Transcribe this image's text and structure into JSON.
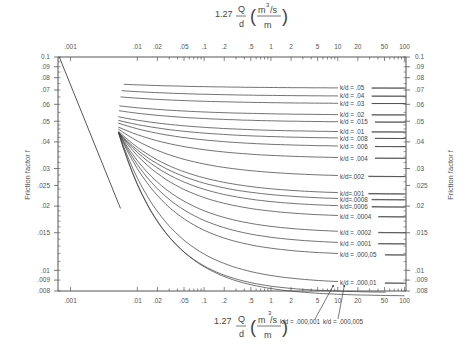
{
  "chart_data": {
    "type": "line",
    "title": "",
    "xlabel": "1.27 Q/d (m³/s / m)",
    "xlabel_parts": {
      "coef": "1.27",
      "num": "Q",
      "den": "d",
      "unit_num": "m",
      "unit_sup": "3",
      "unit_num_rest": "/s",
      "unit_den": "m"
    },
    "ylabel": "Friction factor f",
    "xscale": "log",
    "yscale": "log",
    "xlim": [
      0.00065,
      105
    ],
    "ylim": [
      0.008,
      0.1
    ],
    "grid": false,
    "x_ticks": [
      0.001,
      0.01,
      0.02,
      0.05,
      0.1,
      0.2,
      0.5,
      1,
      2,
      5,
      10,
      20,
      50,
      100
    ],
    "x_tick_labels": [
      ".001",
      ".01",
      ".02",
      ".05",
      ".1",
      ".2",
      ".5",
      "1",
      "2",
      "5",
      "10",
      "20",
      "50",
      "100"
    ],
    "y_ticks": [
      0.1,
      0.09,
      0.08,
      0.07,
      0.06,
      0.05,
      0.04,
      0.03,
      0.025,
      0.02,
      0.015,
      0.01,
      0.009,
      0.008
    ],
    "y_tick_labels_left": [
      "0.1",
      ".09",
      ".08",
      ".07",
      ".06",
      ".05",
      ".04",
      ".03",
      ".025",
      ".02",
      ".015",
      ".01",
      ".009",
      ".008"
    ],
    "y_tick_labels_right": [
      "0.1",
      ".09",
      ".08",
      ".07",
      ".06",
      ".05",
      ".04",
      ".03",
      ".025",
      ".02",
      ".015",
      ".01",
      ".009",
      ".008"
    ],
    "laminar_line": {
      "x": [
        0.00068,
        0.0056
      ],
      "y": [
        0.1,
        0.0195
      ]
    },
    "series": [
      {
        "name": "k/d = .05",
        "label": "k/d = .05",
        "x_start": 0.0063,
        "f_start": 0.0745,
        "f_end": 0.0715,
        "label_f": 0.0715
      },
      {
        "name": "k/d = .04",
        "label": "k/d = .04",
        "x_start": 0.0058,
        "f_start": 0.0695,
        "f_end": 0.0655,
        "label_f": 0.0655
      },
      {
        "name": "k/d = .03",
        "label": "k/d = .03",
        "x_start": 0.0056,
        "f_start": 0.065,
        "f_end": 0.0605,
        "label_f": 0.0605
      },
      {
        "name": "k/d = .02",
        "label": "k/d = .02",
        "x_start": 0.0054,
        "f_start": 0.059,
        "f_end": 0.0535,
        "label_f": 0.0535
      },
      {
        "name": "k/d = .015",
        "label": "k/d = .015",
        "x_start": 0.0053,
        "f_start": 0.056,
        "f_end": 0.0495,
        "label_f": 0.0495
      },
      {
        "name": "k/d = .01",
        "label": "k/d = .01",
        "x_start": 0.0052,
        "f_start": 0.0525,
        "f_end": 0.0445,
        "label_f": 0.0445
      },
      {
        "name": "k/d = .008",
        "label": "k/d = .008",
        "x_start": 0.0052,
        "f_start": 0.0505,
        "f_end": 0.0415,
        "label_f": 0.0415
      },
      {
        "name": "k/d = .006",
        "label": "k/d = .006",
        "x_start": 0.0052,
        "f_start": 0.049,
        "f_end": 0.038,
        "label_f": 0.038
      },
      {
        "name": "k/d = .004",
        "label": "k/d = .004",
        "x_start": 0.0052,
        "f_start": 0.047,
        "f_end": 0.0335,
        "label_f": 0.0335
      },
      {
        "name": "k/d = .002",
        "label": "k/d=.002",
        "x_start": 0.0052,
        "f_start": 0.046,
        "f_end": 0.0275,
        "label_f": 0.0275
      },
      {
        "name": "k/d = .001",
        "label": "k/d=.001",
        "x_start": 0.0052,
        "f_start": 0.045,
        "f_end": 0.0228,
        "label_f": 0.0228
      },
      {
        "name": "k/d = .0008",
        "label": "k/d=.0008",
        "x_start": 0.0052,
        "f_start": 0.0445,
        "f_end": 0.0214,
        "label_f": 0.0214
      },
      {
        "name": "k/d = .0006",
        "label": "k/d=.0006",
        "x_start": 0.0052,
        "f_start": 0.0445,
        "f_end": 0.0198,
        "label_f": 0.0198
      },
      {
        "name": "k/d = .0004",
        "label": "k/d = .0004",
        "x_start": 0.0052,
        "f_start": 0.0445,
        "f_end": 0.0178,
        "label_f": 0.0178
      },
      {
        "name": "k/d = .0002",
        "label": "k/d = .0002",
        "x_start": 0.0052,
        "f_start": 0.0445,
        "f_end": 0.015,
        "label_f": 0.015
      },
      {
        "name": "k/d = .0001",
        "label": "k/d = .0001",
        "x_start": 0.0052,
        "f_start": 0.0445,
        "f_end": 0.0133,
        "label_f": 0.0133
      },
      {
        "name": "k/d = .000,05",
        "label": "k/d = .000,05",
        "x_start": 0.0052,
        "f_start": 0.0445,
        "f_end": 0.0118,
        "label_f": 0.0118
      },
      {
        "name": "k/d = .000,01",
        "label": "k/d = .000,01",
        "x_start": 0.0052,
        "f_start": 0.0445,
        "f_end": 0.0087,
        "label_f": 0.0087
      },
      {
        "name": "k/d = .000,005",
        "label": "k/d = .000,005",
        "x_start": 0.0052,
        "f_start": 0.0445,
        "f_end": 0.0079,
        "end_x": 52
      },
      {
        "name": "k/d = .000,001",
        "label": "k/d = .000,001",
        "x_start": 0.0052,
        "f_start": 0.0445,
        "f_end": 0.0076,
        "end_x": 100
      }
    ],
    "bottom_callouts": [
      {
        "label": "k/d = .000,001",
        "points_to_x": 8.5
      },
      {
        "label": "k/d = .000,005",
        "points_to_x": 12.5
      }
    ]
  }
}
